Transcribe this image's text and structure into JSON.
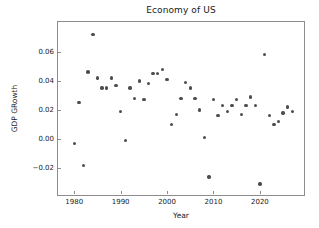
{
  "chart_data": {
    "type": "scatter",
    "title": "Economy of US",
    "xlabel": "Year",
    "ylabel": "GDP GRowth",
    "xlim": [
      1976.5,
      2029.5
    ],
    "ylim": [
      -0.0385,
      0.0805
    ],
    "xticks": [
      1980,
      1990,
      2000,
      2010,
      2020
    ],
    "xtick_labels": [
      "1980",
      "1990",
      "2000",
      "2010",
      "2020"
    ],
    "yticks": [
      0.06,
      0.04,
      0.02,
      0.0,
      -0.02
    ],
    "ytick_labels": [
      "0.06",
      "0.04",
      "0.02",
      "0.00",
      "−0.02"
    ],
    "grid": false,
    "legend": null,
    "marker_color": "#4d4d4d",
    "axes_color": "#8c8c8c",
    "background_color": "#ffffff",
    "x": [
      1980,
      1981,
      1982,
      1983,
      1984,
      1985,
      1986,
      1987,
      1988,
      1989,
      1990,
      1991,
      1992,
      1993,
      1994,
      1995,
      1996,
      1997,
      1998,
      1999,
      2000,
      2001,
      2002,
      2003,
      2004,
      2005,
      2006,
      2007,
      2008,
      2009,
      2010,
      2011,
      2012,
      2013,
      2014,
      2015,
      2016,
      2017,
      2018,
      2019,
      2020,
      2021,
      2022,
      2023,
      2024,
      2025,
      2026,
      2027
    ],
    "y": [
      -0.003,
      0.025,
      -0.018,
      0.046,
      0.072,
      0.042,
      0.035,
      0.035,
      0.042,
      0.037,
      0.019,
      -0.001,
      0.035,
      0.028,
      0.04,
      0.027,
      0.038,
      0.045,
      0.045,
      0.048,
      0.041,
      0.01,
      0.017,
      0.028,
      0.039,
      0.035,
      0.028,
      0.02,
      0.001,
      -0.026,
      0.027,
      0.016,
      0.023,
      0.019,
      0.023,
      0.027,
      0.017,
      0.023,
      0.029,
      0.023,
      -0.031,
      0.058,
      0.016,
      0.01,
      0.012,
      0.018,
      0.022,
      0.019
    ],
    "series_name": "GDP Growth",
    "n_points": 48
  }
}
